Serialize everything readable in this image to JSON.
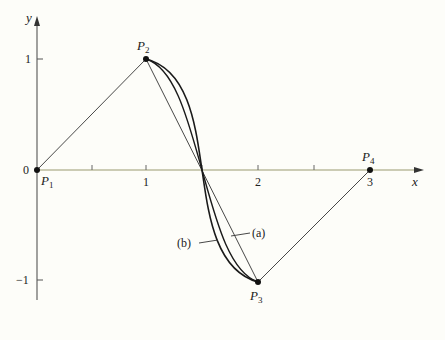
{
  "figure": {
    "axes": {
      "x_label": "x",
      "y_label": "y",
      "origin_label": "0",
      "x_ticks": [
        {
          "value": 1,
          "label": "1"
        },
        {
          "value": 2,
          "label": "2"
        },
        {
          "value": 3,
          "label": "3"
        }
      ],
      "x_minor_ticks": [
        0.5,
        1.5,
        2.5
      ],
      "y_ticks": [
        {
          "value": 1,
          "label": "1"
        },
        {
          "value": -1,
          "label": "−1"
        }
      ]
    },
    "points": [
      {
        "name": "P",
        "sub": "1",
        "x": 0,
        "y": 0
      },
      {
        "name": "P",
        "sub": "2",
        "x": 1,
        "y": 1
      },
      {
        "name": "P",
        "sub": "3",
        "x": 2,
        "y": -1
      },
      {
        "name": "P",
        "sub": "4",
        "x": 3,
        "y": 0
      }
    ],
    "curve_labels": {
      "a": "(a)",
      "b": "(b)"
    },
    "colors": {
      "background": "#fdfdf9",
      "axis": "#555555",
      "x_axis_tint": "#b8b890",
      "curve": "#1a1a1a",
      "polygon": "#333333"
    }
  }
}
